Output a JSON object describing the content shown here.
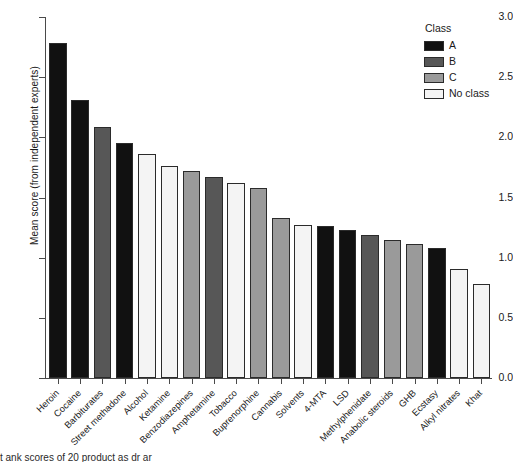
{
  "chart_data": {
    "type": "bar",
    "title": "",
    "xlabel": "",
    "ylabel": "Mean score (from independent experts)",
    "ylim": [
      0.0,
      3.0
    ],
    "yticks": [
      "0.0",
      "0.5",
      "1.0",
      "1.5",
      "2.0",
      "2.5",
      "3.0"
    ],
    "ytick_values": [
      0.0,
      0.5,
      1.0,
      1.5,
      2.0,
      2.5,
      3.0
    ],
    "grid": false,
    "legend_position": "top-right",
    "legend_title": "Class",
    "legend_entries": [
      {
        "label": "A",
        "color": "#111111"
      },
      {
        "label": "B",
        "color": "#575757"
      },
      {
        "label": "C",
        "color": "#9a9a9a"
      },
      {
        "label": "No class",
        "color": "#f4f4f4"
      }
    ],
    "categories": [
      "Heroin",
      "Cocaine",
      "Barbiturates",
      "Street methadone",
      "Alcohol",
      "Ketamine",
      "Benzodiazepines",
      "Amphetamine",
      "Tobacco",
      "Buprenorphine",
      "Cannabis",
      "Solvents",
      "4-MTA",
      "LSD",
      "Methylphenidate",
      "Anabolic steroids",
      "GHB",
      "Ecstasy",
      "Alkyl nitrates",
      "Khat"
    ],
    "values": [
      2.78,
      2.31,
      2.09,
      1.95,
      1.86,
      1.76,
      1.72,
      1.67,
      1.62,
      1.58,
      1.33,
      1.27,
      1.26,
      1.23,
      1.19,
      1.15,
      1.11,
      1.08,
      0.91,
      0.78
    ],
    "classes": [
      "A",
      "A",
      "B",
      "A",
      "No class",
      "No class",
      "C",
      "B",
      "No class",
      "C",
      "C",
      "No class",
      "A",
      "A",
      "B",
      "C",
      "C",
      "A",
      "No class",
      "No class"
    ]
  },
  "caption": {
    "text": "t ank scores of 20 product as dr ar"
  }
}
